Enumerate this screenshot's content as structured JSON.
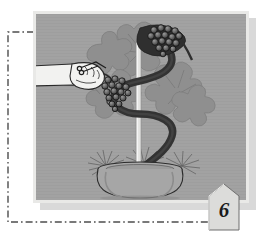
{
  "figure": {
    "caption_number": "6",
    "panel_background": "#a2a2a2",
    "mat_color": "#e9e9e7",
    "shadow_color": "#d9d9d9",
    "ink_color": "#2b2b2b",
    "foliage_color": "#8d8d8d",
    "vine_color": "#3a3a3a",
    "hand_fill": "#efefef",
    "stake_color": "#e2e2e2"
  },
  "scene": {
    "title": "Pruning a grape vine trained on a spiral stake in a pot",
    "elements": {
      "hand": "hand-holding-pruning-shears",
      "shears": "pruning-shears",
      "held_cluster": "grape-cluster-in-hand",
      "top_cluster": "grape-cluster-on-vine",
      "vine": "spiral-trained-vine",
      "stake": "vertical-support-stake",
      "foliage": "grape-foliage",
      "pot": "terracotta-pot"
    }
  },
  "annotation": {
    "bracket_style": "dash-dot",
    "bracket_color": "#5a5a5a"
  }
}
